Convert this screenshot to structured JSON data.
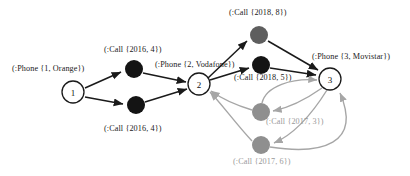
{
  "diagram": {
    "colors": {
      "phone_node_fill": "#ffffff",
      "phone_node_stroke": "#1a1a1a",
      "call_node_black": "#141414",
      "call_node_dark_gray": "#5e5e5e",
      "call_node_gray": "#8f8f8f",
      "edge_black": "#1a1a1a",
      "edge_gray": "#a6a6a6",
      "label_black": "#1a1a1a",
      "label_gray": "#9a9a9a"
    },
    "phone_nodes": [
      {
        "id": "phone-1",
        "label": "1",
        "caption": "(:Phone {1, Orange})",
        "cx": 73,
        "cy": 92,
        "r": 11
      },
      {
        "id": "phone-2",
        "label": "2",
        "caption": "(:Phone {2, Vodafone})",
        "cx": 199,
        "cy": 84,
        "r": 11
      },
      {
        "id": "phone-3",
        "label": "3",
        "caption": "(:Phone {3, Movistar})",
        "cx": 330,
        "cy": 79,
        "r": 11
      }
    ],
    "call_nodes": [
      {
        "id": "call-2016-4-top",
        "caption": "(:Call {2016, 4})",
        "cx": 134,
        "cy": 69,
        "r": 9,
        "tone": "black"
      },
      {
        "id": "call-2016-4-bottom",
        "caption": "(:Call {2016, 4})",
        "cx": 136,
        "cy": 105,
        "r": 9,
        "tone": "black"
      },
      {
        "id": "call-2018-8",
        "caption": "(:Call {2018, 8})",
        "cx": 259,
        "cy": 35,
        "r": 9,
        "tone": "dark-gray"
      },
      {
        "id": "call-2018-5",
        "caption": "(:Call {2018, 5})",
        "cx": 261,
        "cy": 65,
        "r": 9,
        "tone": "black"
      },
      {
        "id": "call-2017-3",
        "caption": "(:Call {2017, 3})",
        "cx": 261,
        "cy": 112,
        "r": 9,
        "tone": "gray"
      },
      {
        "id": "call-2017-6",
        "caption": "(:Call {2017, 6})",
        "cx": 261,
        "cy": 145,
        "r": 9,
        "tone": "gray"
      }
    ],
    "captions": [
      {
        "id": "caption-phone-1",
        "text": "(:Phone {1, Orange})",
        "x": 12,
        "y": 64,
        "tone": "black"
      },
      {
        "id": "caption-call-2016-4-top",
        "text": "(:Call {2016, 4})",
        "x": 104,
        "y": 45,
        "tone": "black"
      },
      {
        "id": "caption-call-2016-4-bottom",
        "text": "(:Call {2016, 4})",
        "x": 104,
        "y": 124,
        "tone": "black"
      },
      {
        "id": "caption-phone-2",
        "text": "(:Phone {2, Vodafone})",
        "x": 155,
        "y": 60,
        "tone": "black"
      },
      {
        "id": "caption-call-2018-8",
        "text": "(:Call {2018, 8})",
        "x": 229,
        "y": 8,
        "tone": "black"
      },
      {
        "id": "caption-phone-3",
        "text": "(:Phone {3, Movistar})",
        "x": 312,
        "y": 52,
        "tone": "black"
      },
      {
        "id": "caption-call-2018-5",
        "text": "(:Call {2018, 5})",
        "x": 234,
        "y": 73,
        "tone": "black"
      },
      {
        "id": "caption-call-2017-3",
        "text": "(:Call {2017, 3})",
        "x": 266,
        "y": 117,
        "tone": "gray"
      },
      {
        "id": "caption-call-2017-6",
        "text": "(:Call {2017, 6})",
        "x": 233,
        "y": 157,
        "tone": "gray"
      }
    ],
    "edges": [
      {
        "id": "edge-phone1-to-call2016top",
        "from": "phone-1",
        "to": "call-2016-4-top",
        "tone": "black"
      },
      {
        "id": "edge-phone1-to-call2016bottom",
        "from": "phone-1",
        "to": "call-2016-4-bottom",
        "tone": "black"
      },
      {
        "id": "edge-call2016top-to-phone2",
        "from": "call-2016-4-top",
        "to": "phone-2",
        "tone": "black"
      },
      {
        "id": "edge-call2016bottom-to-phone2",
        "from": "call-2016-4-bottom",
        "to": "phone-2",
        "tone": "black"
      },
      {
        "id": "edge-phone2-to-call2018-8",
        "from": "phone-2",
        "to": "call-2018-8",
        "tone": "black"
      },
      {
        "id": "edge-phone2-to-call2018-5",
        "from": "phone-2",
        "to": "call-2018-5",
        "tone": "black"
      },
      {
        "id": "edge-call2018-8-to-phone3",
        "from": "call-2018-8",
        "to": "phone-3",
        "tone": "black"
      },
      {
        "id": "edge-call2018-5-to-phone3",
        "from": "call-2018-5",
        "to": "phone-3",
        "tone": "black"
      },
      {
        "id": "edge-phone3-to-call2017-3",
        "from": "phone-3",
        "to": "call-2017-3",
        "tone": "gray"
      },
      {
        "id": "edge-call2017-3-to-phone2",
        "from": "call-2017-3",
        "to": "phone-2",
        "tone": "gray"
      },
      {
        "id": "edge-phone3-to-call2017-6",
        "from": "phone-3",
        "to": "call-2017-6",
        "tone": "gray"
      },
      {
        "id": "edge-call2017-6-to-phone2",
        "from": "call-2017-6",
        "to": "phone-2",
        "tone": "gray"
      },
      {
        "id": "edge-call2017-3-to-phone3",
        "from": "call-2017-3",
        "to": "phone-3",
        "tone": "gray"
      },
      {
        "id": "edge-call2017-6-to-phone3",
        "from": "call-2017-6",
        "to": "phone-3",
        "tone": "gray"
      }
    ]
  }
}
